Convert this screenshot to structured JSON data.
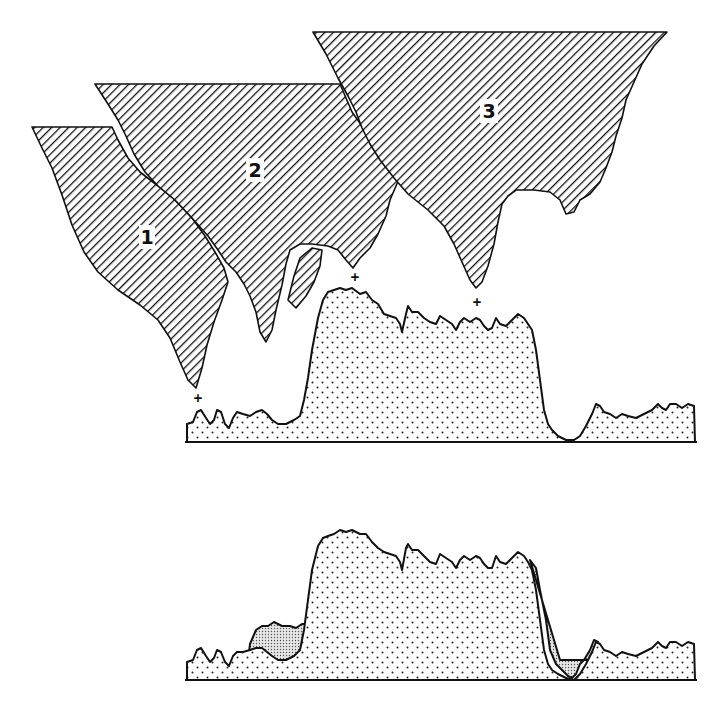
{
  "figure": {
    "regions": [
      {
        "id": "1",
        "label": "1"
      },
      {
        "id": "2",
        "label": "2"
      },
      {
        "id": "3",
        "label": "3"
      }
    ],
    "markers": [
      "+",
      "+",
      "+"
    ],
    "profiles": [
      {
        "name": "upper-profile",
        "description": "stippled intensity profile beneath regions"
      },
      {
        "name": "lower-profile",
        "description": "overlaid profiles with shaded difference"
      }
    ],
    "colors": {
      "ink": "#111111",
      "background": "#ffffff"
    }
  }
}
